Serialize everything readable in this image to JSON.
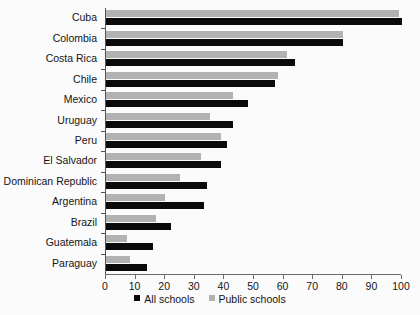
{
  "chart_data": {
    "type": "bar",
    "orientation": "horizontal",
    "title": "",
    "xlabel": "",
    "ylabel": "",
    "xlim": [
      0,
      100
    ],
    "xticks": [
      0,
      10,
      20,
      30,
      40,
      50,
      60,
      70,
      80,
      90,
      100
    ],
    "grid": false,
    "legend_position": "bottom",
    "categories": [
      "Cuba",
      "Colombia",
      "Costa Rica",
      "Chile",
      "Mexico",
      "Uruguay",
      "Peru",
      "El Salvador",
      "Dominican Republic",
      "Argentina",
      "Brazil",
      "Guatemala",
      "Paraguay"
    ],
    "series": [
      {
        "name": "All schools",
        "color": "#0a0a0a",
        "values": [
          100,
          80,
          64,
          57,
          48,
          43,
          41,
          39,
          34,
          33,
          22,
          16,
          14
        ]
      },
      {
        "name": "Public schools",
        "color": "#b2b2b2",
        "values": [
          99,
          80,
          61,
          58,
          43,
          35,
          39,
          32,
          25,
          20,
          17,
          7,
          8
        ]
      }
    ]
  },
  "legend": {
    "items": [
      {
        "label": "All schools",
        "swatch": "all"
      },
      {
        "label": "Public schools",
        "swatch": "public"
      }
    ]
  }
}
